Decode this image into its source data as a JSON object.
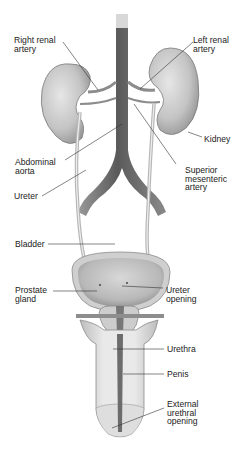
{
  "diagram": {
    "labels": {
      "right_renal_artery": "Right renal\nartery",
      "left_renal_artery": "Left renal\nartery",
      "kidney": "Kidney",
      "abdominal_aorta": "Abdominal\naorta",
      "superior_mesenteric_artery": "Superior\nmesenteric\nartery",
      "ureter": "Ureter",
      "bladder": "Bladder",
      "prostate_gland": "Prostate\ngland",
      "ureter_opening": "Ureter\nopening",
      "urethra": "Urethra",
      "penis": "Penis",
      "external_urethral_opening": "External\nurethral\nopening"
    },
    "colors": {
      "organ_fill": "#c9c9c9",
      "organ_dark": "#8a8a8a",
      "aorta": "#6e6e6e",
      "leader_line": "#333333",
      "background": "#ffffff"
    }
  }
}
